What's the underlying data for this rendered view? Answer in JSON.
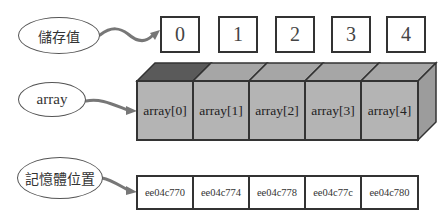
{
  "labels": {
    "stored_values": "儲存值",
    "array": "array",
    "memory_location": "記憶體位置"
  },
  "indices": [
    "0",
    "1",
    "2",
    "3",
    "4"
  ],
  "elements": [
    "array[0]",
    "array[1]",
    "array[2]",
    "array[3]",
    "array[4]"
  ],
  "addresses": [
    "ee04c770",
    "ee04c774",
    "ee04c778",
    "ee04c77c",
    "ee04c780"
  ],
  "colors": {
    "cube_front": "#b4b4b4",
    "cube_top": "#a6a6a6",
    "cube_top_first": "#5a5a5a",
    "cube_side": "#9c9c9c",
    "stroke": "#333333",
    "arrow": "#777777"
  }
}
